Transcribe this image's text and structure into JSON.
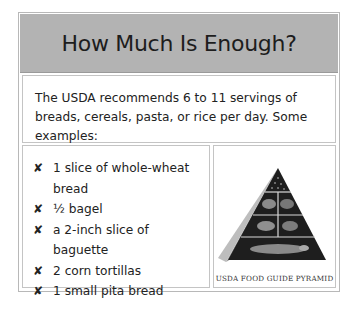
{
  "header": {
    "title": "How Much Is Enough?"
  },
  "intro": {
    "text": "The USDA recommends 6 to 11 servings of breads, cereals, pasta, or rice per day. Some examples:"
  },
  "examples": {
    "bullet_icon": "x-mark-icon",
    "bullet_glyph": "✘",
    "items": [
      {
        "label": "1 slice of whole-wheat bread"
      },
      {
        "label": "½ bagel"
      },
      {
        "label": "a 2-inch slice of baguette"
      },
      {
        "label": "2 corn tortillas"
      },
      {
        "label": "1 small pita bread"
      }
    ]
  },
  "figure": {
    "image": "food-guide-pyramid-image",
    "caption": "USDA FOOD GUIDE PYRAMID"
  },
  "colors": {
    "header_bg": "#b3b3b3",
    "border": "#c4c4c4",
    "text": "#222222"
  }
}
